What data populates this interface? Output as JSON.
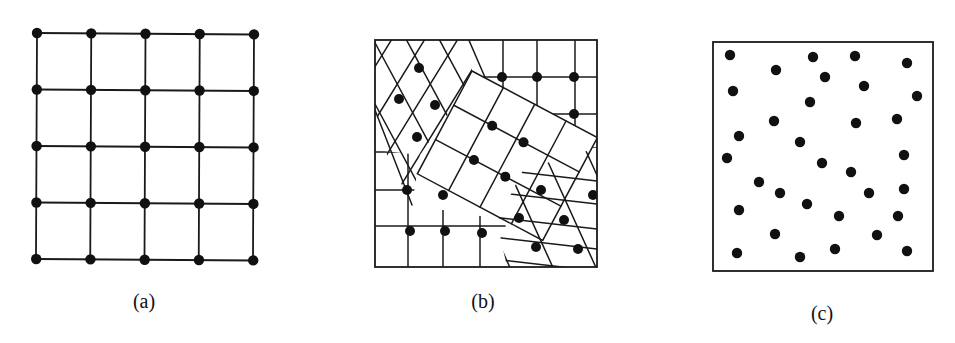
{
  "figure": {
    "panels": [
      {
        "id": "a",
        "caption": "(a)",
        "kind": "regular-lattice",
        "grid": {
          "rows": 5,
          "cols": 5,
          "x0": 37,
          "y0": 33,
          "x1": 254,
          "y1": 259
        }
      },
      {
        "id": "b",
        "caption": "(b)",
        "kind": "polycrystalline-grains",
        "frame": {
          "x": 375,
          "y": 40,
          "w": 222,
          "h": 227
        }
      },
      {
        "id": "c",
        "caption": "(c)",
        "kind": "amorphous-random",
        "frame": {
          "x": 713,
          "y": 42,
          "w": 220,
          "h": 229
        },
        "points": [
          [
            730,
            55
          ],
          [
            813,
            57
          ],
          [
            855,
            56
          ],
          [
            907,
            63
          ],
          [
            776,
            70
          ],
          [
            825,
            77
          ],
          [
            864,
            86
          ],
          [
            733,
            91
          ],
          [
            917,
            96
          ],
          [
            810,
            102
          ],
          [
            774,
            121
          ],
          [
            856,
            123
          ],
          [
            897,
            119
          ],
          [
            739,
            136
          ],
          [
            800,
            142
          ],
          [
            727,
            158
          ],
          [
            904,
            155
          ],
          [
            822,
            163
          ],
          [
            851,
            172
          ],
          [
            759,
            182
          ],
          [
            780,
            193
          ],
          [
            869,
            193
          ],
          [
            904,
            189
          ],
          [
            739,
            210
          ],
          [
            807,
            204
          ],
          [
            839,
            216
          ],
          [
            898,
            216
          ],
          [
            775,
            234
          ],
          [
            877,
            235
          ],
          [
            737,
            253
          ],
          [
            800,
            257
          ],
          [
            835,
            249
          ],
          [
            907,
            251
          ]
        ]
      }
    ],
    "caption_positions": [
      {
        "x": 144,
        "y": 290
      },
      {
        "x": 483,
        "y": 290
      },
      {
        "x": 822,
        "y": 302
      }
    ],
    "colors": {
      "line": "#1a1a1a",
      "dot": "#111111",
      "background": "#ffffff"
    }
  }
}
